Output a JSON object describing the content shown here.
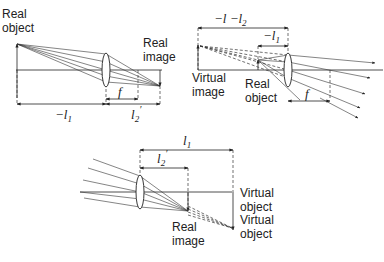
{
  "diagrams": [
    {
      "id": "converging-real-object-real-image",
      "labels": {
        "object": [
          "Real",
          "object"
        ],
        "image": [
          "Real",
          "image"
        ],
        "object_distance": "−l",
        "object_distance_sub": "1",
        "image_distance": "l",
        "image_distance_sub": "2",
        "image_distance_prime": "′",
        "focal": "f"
      }
    },
    {
      "id": "virtual-image-real-object",
      "labels": {
        "image": [
          "Virtual",
          "image"
        ],
        "object": [
          "Real",
          "object"
        ],
        "total_distance": "−l  −l",
        "total_distance_sub": "2",
        "object_distance": "−l",
        "object_distance_sub": "1",
        "focal": "f"
      }
    },
    {
      "id": "virtual-object-real-image",
      "labels": {
        "object_distance": "l",
        "object_distance_sub": "1",
        "image_distance": "l",
        "image_distance_sub": "2",
        "image_distance_prime": "′",
        "image": [
          "Real",
          "image"
        ],
        "virtual_object_1": [
          "Virtual",
          "object"
        ],
        "virtual_object_2": [
          "Virtual",
          "object"
        ]
      }
    }
  ],
  "colors": {
    "line": "#222222",
    "background": "#ffffff"
  }
}
